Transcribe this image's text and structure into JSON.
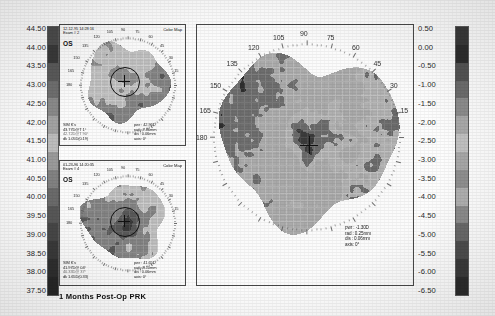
{
  "document": {
    "type": "corneal-topography-printout",
    "caption": "1 Months  Post-Op  PRK"
  },
  "left_scale": {
    "name": "axial-power-diopter-scale",
    "unit": "D",
    "ticks": [
      "44.50",
      "44.00",
      "43.50",
      "43.00",
      "42.50",
      "42.00",
      "41.50",
      "41.00",
      "40.50",
      "40.00",
      "39.50",
      "39.00",
      "38.50",
      "38.00",
      "37.50"
    ],
    "swatches": [
      "#4c4c4c",
      "#3a3a3a",
      "#5a5a5a",
      "#6f6f6f",
      "#8a8a8a",
      "#a3a3a3",
      "#bdbdbd",
      "#9a9a9a",
      "#828282",
      "#6b6b6b",
      "#585858",
      "#474747",
      "#3a3a3a",
      "#2f2f2f",
      "#272727"
    ]
  },
  "right_scale": {
    "name": "difference-diopter-scale",
    "unit": "D",
    "ticks": [
      "0.50",
      "0.00",
      "-0.50",
      "-1.00",
      "-1.50",
      "-2.00",
      "-2.50",
      "-3.00",
      "-3.50",
      "-4.00",
      "-4.50",
      "-5.00",
      "-5.50",
      "-6.00",
      "-6.50"
    ],
    "swatches": [
      "#3a3a3a",
      "#2e2e2e",
      "#545454",
      "#6d6d6d",
      "#8d8d8d",
      "#aaaaaa",
      "#c2c2c2",
      "#a8a8a8",
      "#909090",
      "#b0b0b0",
      "#8c8c8c",
      "#6a6a6a",
      "#4e4e4e",
      "#3b3b3b",
      "#2c2c2c"
    ]
  },
  "panel_top": {
    "title_date": "12-12-95 14:28:16",
    "exam": "Exam # 2",
    "eye": "OS",
    "colormap_label": "Color Map",
    "degrees": [
      "105",
      "90",
      "75",
      "120",
      "60",
      "135",
      "45",
      "150",
      "30",
      "165",
      "15",
      "180"
    ],
    "sim_k": {
      "heading": "SIM K's",
      "line1": "43.77D@T 1°",
      "line2": "42.72D@T 90°",
      "line3": "dk 1.05D(0.19)"
    },
    "readout": {
      "pwr": "pwr : 42.96D",
      "rad": "rad : 7.86mm",
      "dis": "dis : 0.06mm",
      "axis": "axis:  0°"
    }
  },
  "panel_bottom": {
    "title_date": "01-23-96 14:20:35",
    "exam": "Exam # 4",
    "eye": "OS",
    "colormap_label": "Color Map",
    "degrees": [
      "105",
      "90",
      "75",
      "120",
      "60",
      "135",
      "45",
      "150",
      "30",
      "165",
      "15",
      "180"
    ],
    "sim_k": {
      "heading": "SIM K's",
      "line1": "41.97D@ 04°",
      "line2": "40.33D@ 37°",
      "line3": "dk 1.65D(0.33)"
    },
    "readout": {
      "pwr": "pwr : 41.65D",
      "rad": "rad : 8.10mm",
      "dis": "dis : 0.06mm",
      "axis": "axis:  0°"
    }
  },
  "panel_main": {
    "name": "difference-map",
    "degrees": [
      "105",
      "90",
      "75",
      "120",
      "60",
      "135",
      "45",
      "150",
      "30",
      "165",
      "15",
      "180"
    ],
    "readout": {
      "pwr": "pwr : -1.30D",
      "rad": "rad : 0.25mm",
      "dis": "dis : 0.06mm",
      "axis": "axis:   0°"
    }
  },
  "chart_data": {
    "type": "heatmap",
    "maps": [
      {
        "id": "pre-op-axial-map",
        "label": "Exam # 2 OS 12-12-95 14:28:16",
        "scale": "left",
        "unit": "D",
        "zlim": [
          37.5,
          44.5
        ],
        "center_power": 42.96,
        "center_radius_mm": 7.86,
        "sim_k_steep": 43.77,
        "sim_k_steep_axis": 1,
        "sim_k_flat": 42.72,
        "sim_k_flat_axis": 90,
        "cylinder": 1.05
      },
      {
        "id": "post-op-axial-map",
        "label": "Exam # 4 OS 01-23-96 14:20:35",
        "scale": "left",
        "unit": "D",
        "zlim": [
          37.5,
          44.5
        ],
        "center_power": 41.65,
        "center_radius_mm": 8.1,
        "sim_k_steep": 41.97,
        "sim_k_steep_axis": 4,
        "sim_k_flat": 40.33,
        "sim_k_flat_axis": 37,
        "cylinder": 1.65
      },
      {
        "id": "difference-map",
        "label": "Difference map (Exam 4 - Exam 2)",
        "scale": "right",
        "unit": "D",
        "zlim": [
          -6.5,
          0.5
        ],
        "center_power": -1.3,
        "center_radius_mm": 0.25
      }
    ],
    "meridian_ticks": [
      0,
      15,
      30,
      45,
      60,
      75,
      90,
      105,
      120,
      135,
      150,
      165,
      180
    ],
    "grid": true,
    "legend": "vertical color bars on left (37.50 to 44.50 D) and right (-6.50 to 0.50 D)"
  }
}
